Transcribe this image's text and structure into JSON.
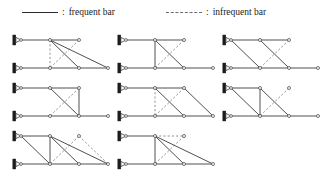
{
  "legend": {
    "frequent": {
      "swatch": "solid-line",
      "separator": ":",
      "label": "frequent bar"
    },
    "infrequent": {
      "swatch": "dashed-line",
      "separator": ":",
      "label": "infrequent bar"
    }
  },
  "colors": {
    "frequent_bar": "#3c3c3c",
    "infrequent_bar": "#8a8a8a",
    "support": "#1c1c1c",
    "background": "#ffffff"
  },
  "chart_data": {
    "type": "diagram",
    "title": "",
    "subtitle": "",
    "grid": {
      "rows": 3,
      "columns": 3,
      "cells_used": 8
    },
    "geometry_units": "cell-local pixels",
    "node_grid": {
      "top_y": 10,
      "bottom_y": 38,
      "x_columns": [
        18,
        47,
        76,
        105
      ]
    },
    "trusses": [
      {
        "id": "truss-1",
        "row": 1,
        "column": 1,
        "supports": [
          {
            "x": 18,
            "y": 10
          },
          {
            "x": 18,
            "y": 38
          }
        ],
        "nodes": [
          {
            "id": "t0",
            "x": 18,
            "y": 10
          },
          {
            "id": "t1",
            "x": 47,
            "y": 10
          },
          {
            "id": "t2",
            "x": 76,
            "y": 10
          },
          {
            "id": "b0",
            "x": 18,
            "y": 38
          },
          {
            "id": "b1",
            "x": 47,
            "y": 38
          },
          {
            "id": "b2",
            "x": 76,
            "y": 38
          },
          {
            "id": "b3",
            "x": 105,
            "y": 38
          }
        ],
        "bars": [
          {
            "from": "t0",
            "to": "t1",
            "kind": "frequent"
          },
          {
            "from": "t1",
            "to": "t2",
            "kind": "frequent"
          },
          {
            "from": "b0",
            "to": "b1",
            "kind": "frequent"
          },
          {
            "from": "b1",
            "to": "b2",
            "kind": "frequent"
          },
          {
            "from": "b2",
            "to": "b3",
            "kind": "frequent"
          },
          {
            "from": "t1",
            "to": "b2",
            "kind": "frequent"
          },
          {
            "from": "t1",
            "to": "b3",
            "kind": "frequent"
          },
          {
            "from": "t1",
            "to": "b1",
            "kind": "infrequent"
          },
          {
            "from": "t2",
            "to": "b1",
            "kind": "infrequent"
          }
        ]
      },
      {
        "id": "truss-2",
        "row": 1,
        "column": 2,
        "supports": [
          {
            "x": 18,
            "y": 10
          },
          {
            "x": 18,
            "y": 38
          }
        ],
        "nodes": [
          {
            "id": "t0",
            "x": 18,
            "y": 10
          },
          {
            "id": "t1",
            "x": 47,
            "y": 10
          },
          {
            "id": "t2",
            "x": 76,
            "y": 10
          },
          {
            "id": "b0",
            "x": 18,
            "y": 38
          },
          {
            "id": "b1",
            "x": 47,
            "y": 38
          },
          {
            "id": "b2",
            "x": 76,
            "y": 38
          },
          {
            "id": "b3",
            "x": 105,
            "y": 38
          }
        ],
        "bars": [
          {
            "from": "t0",
            "to": "t1",
            "kind": "frequent"
          },
          {
            "from": "t1",
            "to": "t2",
            "kind": "frequent"
          },
          {
            "from": "b0",
            "to": "b1",
            "kind": "frequent"
          },
          {
            "from": "b1",
            "to": "b2",
            "kind": "frequent"
          },
          {
            "from": "b2",
            "to": "b3",
            "kind": "frequent"
          },
          {
            "from": "t1",
            "to": "b1",
            "kind": "frequent"
          },
          {
            "from": "t1",
            "to": "b2",
            "kind": "frequent"
          },
          {
            "from": "t2",
            "to": "b1",
            "kind": "infrequent"
          }
        ]
      },
      {
        "id": "truss-3",
        "row": 1,
        "column": 3,
        "supports": [
          {
            "x": 18,
            "y": 10
          },
          {
            "x": 18,
            "y": 38
          }
        ],
        "nodes": [
          {
            "id": "t0",
            "x": 18,
            "y": 10
          },
          {
            "id": "t1",
            "x": 47,
            "y": 10
          },
          {
            "id": "t2",
            "x": 76,
            "y": 10
          },
          {
            "id": "b0",
            "x": 18,
            "y": 38
          },
          {
            "id": "b1",
            "x": 47,
            "y": 38
          },
          {
            "id": "b2",
            "x": 76,
            "y": 38
          },
          {
            "id": "b3",
            "x": 105,
            "y": 38
          }
        ],
        "bars": [
          {
            "from": "t0",
            "to": "t1",
            "kind": "frequent"
          },
          {
            "from": "t1",
            "to": "t2",
            "kind": "frequent"
          },
          {
            "from": "b0",
            "to": "b1",
            "kind": "frequent"
          },
          {
            "from": "b1",
            "to": "b2",
            "kind": "frequent"
          },
          {
            "from": "b2",
            "to": "b3",
            "kind": "frequent"
          },
          {
            "from": "t0",
            "to": "b1",
            "kind": "frequent"
          },
          {
            "from": "t1",
            "to": "b2",
            "kind": "frequent"
          },
          {
            "from": "t2",
            "to": "b1",
            "kind": "infrequent"
          }
        ]
      },
      {
        "id": "truss-4",
        "row": 2,
        "column": 1,
        "supports": [
          {
            "x": 18,
            "y": 10
          },
          {
            "x": 18,
            "y": 38
          }
        ],
        "nodes": [
          {
            "id": "t0",
            "x": 18,
            "y": 10
          },
          {
            "id": "t1",
            "x": 47,
            "y": 10
          },
          {
            "id": "t2",
            "x": 76,
            "y": 10
          },
          {
            "id": "b0",
            "x": 18,
            "y": 38
          },
          {
            "id": "b1",
            "x": 47,
            "y": 38
          },
          {
            "id": "b2",
            "x": 76,
            "y": 38
          },
          {
            "id": "b3",
            "x": 105,
            "y": 38
          }
        ],
        "bars": [
          {
            "from": "t0",
            "to": "t1",
            "kind": "frequent"
          },
          {
            "from": "t1",
            "to": "t2",
            "kind": "frequent"
          },
          {
            "from": "b0",
            "to": "b1",
            "kind": "frequent"
          },
          {
            "from": "b1",
            "to": "b2",
            "kind": "frequent"
          },
          {
            "from": "b2",
            "to": "b3",
            "kind": "frequent"
          },
          {
            "from": "t2",
            "to": "b2",
            "kind": "frequent"
          },
          {
            "from": "t1",
            "to": "b2",
            "kind": "frequent"
          },
          {
            "from": "t2",
            "to": "b1",
            "kind": "infrequent"
          }
        ]
      },
      {
        "id": "truss-5",
        "row": 2,
        "column": 2,
        "supports": [
          {
            "x": 18,
            "y": 10
          },
          {
            "x": 18,
            "y": 38
          }
        ],
        "nodes": [
          {
            "id": "t0",
            "x": 18,
            "y": 10
          },
          {
            "id": "t1",
            "x": 47,
            "y": 10
          },
          {
            "id": "t2",
            "x": 76,
            "y": 10
          },
          {
            "id": "b0",
            "x": 18,
            "y": 38
          },
          {
            "id": "b1",
            "x": 47,
            "y": 38
          },
          {
            "id": "b2",
            "x": 76,
            "y": 38
          },
          {
            "id": "b3",
            "x": 105,
            "y": 38
          }
        ],
        "bars": [
          {
            "from": "t0",
            "to": "t1",
            "kind": "frequent"
          },
          {
            "from": "t1",
            "to": "t2",
            "kind": "frequent"
          },
          {
            "from": "b0",
            "to": "b1",
            "kind": "frequent"
          },
          {
            "from": "b1",
            "to": "b2",
            "kind": "frequent"
          },
          {
            "from": "b2",
            "to": "b3",
            "kind": "frequent"
          },
          {
            "from": "t1",
            "to": "b2",
            "kind": "frequent"
          },
          {
            "from": "t2",
            "to": "b3",
            "kind": "frequent"
          },
          {
            "from": "t2",
            "to": "b1",
            "kind": "infrequent"
          },
          {
            "from": "t1",
            "to": "b1",
            "kind": "infrequent"
          }
        ]
      },
      {
        "id": "truss-6",
        "row": 2,
        "column": 3,
        "supports": [
          {
            "x": 18,
            "y": 10
          },
          {
            "x": 18,
            "y": 38
          }
        ],
        "nodes": [
          {
            "id": "t0",
            "x": 18,
            "y": 10
          },
          {
            "id": "t1",
            "x": 47,
            "y": 10
          },
          {
            "id": "t2",
            "x": 76,
            "y": 10
          },
          {
            "id": "b0",
            "x": 18,
            "y": 38
          },
          {
            "id": "b1",
            "x": 47,
            "y": 38
          },
          {
            "id": "b2",
            "x": 76,
            "y": 38
          },
          {
            "id": "b3",
            "x": 105,
            "y": 38
          }
        ],
        "bars": [
          {
            "from": "t0",
            "to": "t1",
            "kind": "frequent"
          },
          {
            "from": "b0",
            "to": "b1",
            "kind": "frequent"
          },
          {
            "from": "b1",
            "to": "b2",
            "kind": "frequent"
          },
          {
            "from": "b2",
            "to": "b3",
            "kind": "frequent"
          },
          {
            "from": "t0",
            "to": "b1",
            "kind": "frequent"
          },
          {
            "from": "t1",
            "to": "b1",
            "kind": "frequent"
          },
          {
            "from": "t1",
            "to": "b2",
            "kind": "frequent"
          },
          {
            "from": "t2",
            "to": "b1",
            "kind": "infrequent"
          }
        ]
      },
      {
        "id": "truss-7",
        "row": 3,
        "column": 1,
        "supports": [
          {
            "x": 18,
            "y": 10
          },
          {
            "x": 18,
            "y": 38
          }
        ],
        "nodes": [
          {
            "id": "t0",
            "x": 18,
            "y": 10
          },
          {
            "id": "t1",
            "x": 47,
            "y": 10
          },
          {
            "id": "t2",
            "x": 76,
            "y": 10
          },
          {
            "id": "b0",
            "x": 18,
            "y": 38
          },
          {
            "id": "b1",
            "x": 47,
            "y": 38
          },
          {
            "id": "b2",
            "x": 76,
            "y": 38
          },
          {
            "id": "b3",
            "x": 105,
            "y": 38
          }
        ],
        "bars": [
          {
            "from": "t0",
            "to": "t1",
            "kind": "frequent"
          },
          {
            "from": "b0",
            "to": "b1",
            "kind": "frequent"
          },
          {
            "from": "b1",
            "to": "b2",
            "kind": "frequent"
          },
          {
            "from": "b2",
            "to": "b3",
            "kind": "frequent"
          },
          {
            "from": "t0",
            "to": "b1",
            "kind": "frequent"
          },
          {
            "from": "t1",
            "to": "b1",
            "kind": "frequent"
          },
          {
            "from": "t1",
            "to": "b2",
            "kind": "frequent"
          },
          {
            "from": "t1",
            "to": "b3",
            "kind": "frequent"
          },
          {
            "from": "t2",
            "to": "b1",
            "kind": "infrequent"
          },
          {
            "from": "t2",
            "to": "b3",
            "kind": "infrequent"
          }
        ]
      },
      {
        "id": "truss-8",
        "row": 3,
        "column": 2,
        "supports": [
          {
            "x": 18,
            "y": 10
          },
          {
            "x": 18,
            "y": 38
          }
        ],
        "nodes": [
          {
            "id": "t0",
            "x": 18,
            "y": 10
          },
          {
            "id": "t1",
            "x": 47,
            "y": 10
          },
          {
            "id": "t2",
            "x": 76,
            "y": 10
          },
          {
            "id": "b0",
            "x": 18,
            "y": 38
          },
          {
            "id": "b1",
            "x": 47,
            "y": 38
          },
          {
            "id": "b2",
            "x": 76,
            "y": 38
          },
          {
            "id": "b3",
            "x": 105,
            "y": 38
          }
        ],
        "bars": [
          {
            "from": "t0",
            "to": "t1",
            "kind": "frequent"
          },
          {
            "from": "b0",
            "to": "b1",
            "kind": "frequent"
          },
          {
            "from": "b1",
            "to": "b2",
            "kind": "frequent"
          },
          {
            "from": "b2",
            "to": "b3",
            "kind": "frequent"
          },
          {
            "from": "t1",
            "to": "b1",
            "kind": "frequent"
          },
          {
            "from": "t1",
            "to": "b2",
            "kind": "frequent"
          },
          {
            "from": "t1",
            "to": "b3",
            "kind": "frequent"
          },
          {
            "from": "t2",
            "to": "b1",
            "kind": "infrequent"
          },
          {
            "from": "t1",
            "to": "t2",
            "kind": "infrequent"
          }
        ]
      }
    ]
  }
}
